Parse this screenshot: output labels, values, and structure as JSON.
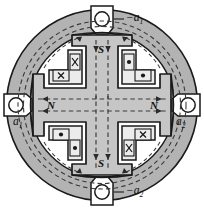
{
  "figure": {
    "name": "four-pole-machine-cross-section",
    "type": "diagram"
  },
  "colors": {
    "outline": "#1a1a1a",
    "yoke_fill": "#b3b3b3",
    "rotor_fill": "#c6c6c6",
    "airgap_fill": "#ffffff",
    "coil_fill": "#ececec",
    "flux_line": "#3a3a3a",
    "terminal_fill": "#ffffff",
    "page_background": "#ffffff"
  },
  "terminals": [
    {
      "id": "terminal-top",
      "label_prefix": "−",
      "label_base": "a",
      "label_sub": "1",
      "position": "top"
    },
    {
      "id": "terminal-left",
      "label_prefix": "",
      "label_base": "a",
      "label_sub": "1",
      "position": "left"
    },
    {
      "id": "terminal-right",
      "label_prefix": "",
      "label_base": "a",
      "label_sub": "2",
      "position": "right"
    },
    {
      "id": "terminal-bottom",
      "label_prefix": "−",
      "label_base": "a",
      "label_sub": "2",
      "position": "bottom"
    }
  ],
  "pole_labels": [
    {
      "id": "pole-top",
      "text": "S",
      "position": "top"
    },
    {
      "id": "pole-left",
      "text": "N",
      "position": "left"
    },
    {
      "id": "pole-right",
      "text": "N",
      "position": "right"
    },
    {
      "id": "pole-bottom",
      "text": "S",
      "position": "bottom"
    }
  ],
  "coils": [
    {
      "id": "coil-top-left",
      "quadrant": "top-left",
      "current": "into-page",
      "marker": "×",
      "count": 2
    },
    {
      "id": "coil-top-right",
      "quadrant": "top-right",
      "current": "out-of-page",
      "marker": "•",
      "count": 2
    },
    {
      "id": "coil-bottom-left",
      "quadrant": "bottom-left",
      "current": "out-of-page",
      "marker": "•",
      "count": 2
    },
    {
      "id": "coil-bottom-right",
      "quadrant": "bottom-right",
      "current": "into-page",
      "marker": "×",
      "count": 2
    }
  ],
  "flux": {
    "style": "dashed",
    "arrow_count": 12,
    "description": "Dashed closed flux loops passing through the stator yoke, air gap and rotor poles"
  }
}
